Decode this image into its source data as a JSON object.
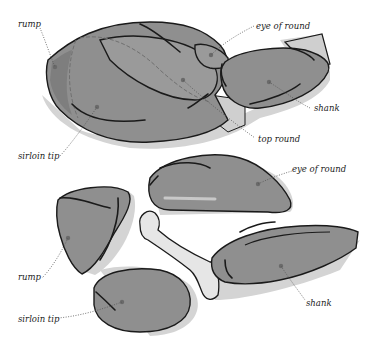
{
  "diagram": {
    "top_group": {
      "labels": {
        "rump": "rump",
        "eye_of_round": "eye of round",
        "shank": "shank",
        "top_round": "top round",
        "sirloin_tip": "sirloin tip"
      }
    },
    "bottom_group": {
      "labels": {
        "eye_of_round": "eye of round",
        "rump": "rump",
        "shank": "shank",
        "sirloin_tip": "sirloin tip"
      }
    },
    "colors": {
      "meat": "#8f8f8f",
      "meat_light": "#9a9a9a",
      "shadow": "#d4d4d4",
      "bone": "#e6e6e6",
      "outline": "#1a1a1a",
      "background": "#ffffff"
    }
  }
}
